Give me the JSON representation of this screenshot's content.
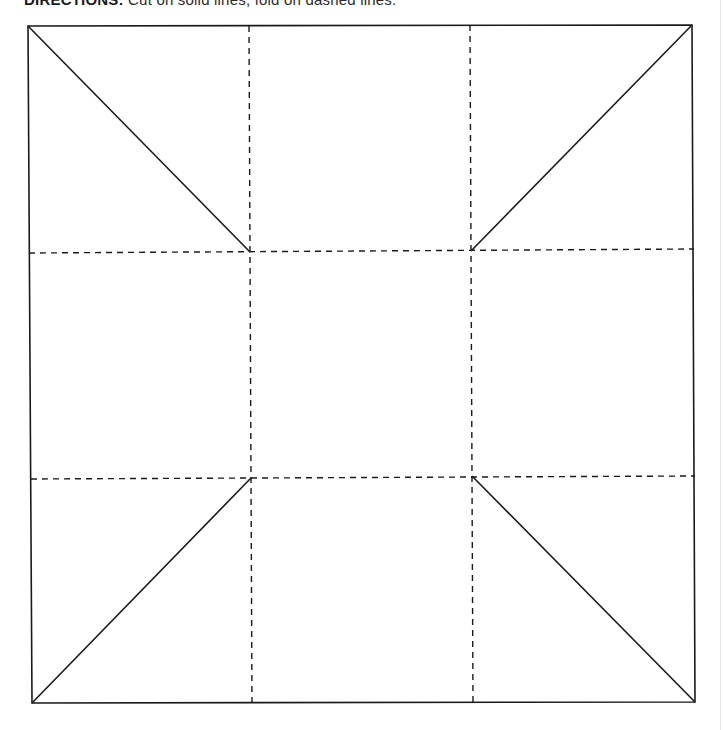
{
  "header": {
    "label": "DIRECTIONS:",
    "text": "Cut on solid lines, fold on dashed lines."
  },
  "diagram": {
    "type": "fold-and-cut template",
    "stroke_color": "#1a1a1a",
    "solid_stroke_width": 1.6,
    "dashed_stroke_width": 1.4,
    "dash_pattern": "6 5",
    "outer_square": {
      "corners": {
        "top_left": [
          28,
          26
        ],
        "top_right": [
          692,
          25
        ],
        "bottom_right": [
          695,
          702
        ],
        "bottom_left": [
          32,
          703
        ]
      }
    },
    "inner_intersections": {
      "top_left": [
        250,
        252
      ],
      "top_right": [
        471,
        251
      ],
      "bottom_left": [
        251,
        478
      ],
      "bottom_right": [
        472,
        476
      ]
    },
    "dashed_lines": {
      "vertical": [
        {
          "name": "vertical-fold-left",
          "from": [
            249,
            26
          ],
          "to": [
            252,
            703
          ]
        },
        {
          "name": "vertical-fold-right",
          "from": [
            470,
            25
          ],
          "to": [
            473,
            702
          ]
        }
      ],
      "horizontal": [
        {
          "name": "horizontal-fold-top",
          "from": [
            29,
            253
          ],
          "to": [
            694,
            249
          ]
        },
        {
          "name": "horizontal-fold-bottom",
          "from": [
            31,
            479
          ],
          "to": [
            695,
            476
          ]
        }
      ]
    },
    "solid_diagonals": [
      {
        "name": "diagonal-cut-top-left",
        "from": [
          28,
          26
        ],
        "to": [
          250,
          252
        ]
      },
      {
        "name": "diagonal-cut-top-right",
        "from": [
          692,
          25
        ],
        "to": [
          471,
          251
        ]
      },
      {
        "name": "diagonal-cut-bottom-left",
        "from": [
          32,
          703
        ],
        "to": [
          251,
          478
        ]
      },
      {
        "name": "diagonal-cut-bottom-right",
        "from": [
          695,
          702
        ],
        "to": [
          472,
          476
        ]
      }
    ]
  }
}
